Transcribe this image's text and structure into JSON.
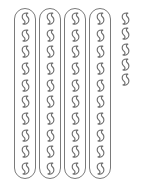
{
  "canvas": {
    "width": 148,
    "height": 186,
    "background": "#ffffff"
  },
  "figure": {
    "kind": "counting-manipulative",
    "counter_icon_name": "bean-counter-icon",
    "tube_icon_name": "ten-frame-tube",
    "total_count": 45,
    "groups_of_ten": 4,
    "leftover_count": 5,
    "outline_color": "#7a7a7a",
    "counter_stroke_color": "#6f6f6f",
    "counter_fill_color": "#ffffff"
  },
  "groups": [
    {
      "label": "Tube 1",
      "type": "tube",
      "count": 10,
      "x": 14,
      "y": 8,
      "width": 22,
      "height": 171
    },
    {
      "label": "Tube 2",
      "type": "tube",
      "count": 10,
      "x": 39,
      "y": 8,
      "width": 22,
      "height": 171
    },
    {
      "label": "Tube 3",
      "type": "tube",
      "count": 10,
      "x": 64,
      "y": 8,
      "width": 22,
      "height": 171
    },
    {
      "label": "Tube 4",
      "type": "tube",
      "count": 10,
      "x": 89,
      "y": 8,
      "width": 22,
      "height": 171
    },
    {
      "label": "Loose counters",
      "type": "loose",
      "count": 5,
      "x": 119,
      "y": 12,
      "width": 13,
      "height": 74
    }
  ]
}
